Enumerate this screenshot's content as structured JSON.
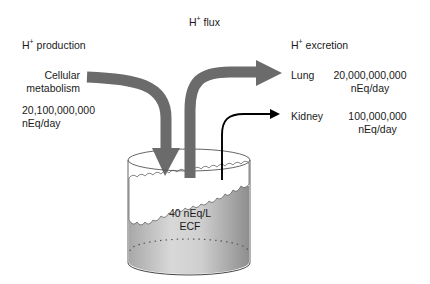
{
  "title": {
    "prefix": "H",
    "sup": "+",
    "text": " flux"
  },
  "production": {
    "heading_prefix": "H",
    "heading_sup": "+",
    "heading_text": " production",
    "source_line1": "Cellular",
    "source_line2": "metabolism",
    "rate_value": "20,100,000,000",
    "rate_unit": "nEq/day"
  },
  "excretion": {
    "heading_prefix": "H",
    "heading_sup": "+",
    "heading_text": " excretion",
    "routes": [
      {
        "organ": "Lung",
        "value": "20,000,000,000",
        "unit": "nEq/day"
      },
      {
        "organ": "Kidney",
        "value": "100,000,000",
        "unit": "nEq/day"
      }
    ]
  },
  "compartment": {
    "concentration": "40 nEq/L",
    "name": "ECF"
  },
  "colors": {
    "arrow_gray": "#6b6b6b",
    "kidney_arrow": "#000000",
    "fluid_light": "#e6e6e6",
    "fluid_dark": "#9a9a9a",
    "outline": "#444444"
  }
}
